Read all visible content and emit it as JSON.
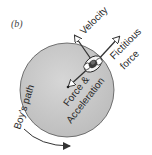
{
  "panel_label": "(b)",
  "labels": {
    "velocity": "Velocity",
    "fictitious_line1": "Fictitious",
    "fictitious_line2": "force",
    "force_line1": "Force &",
    "force_line2": "Acceleration",
    "path": "Boy's path"
  },
  "colors": {
    "disk_fill": "#c9c9c9",
    "disk_stroke": "#555555",
    "arrow": "#333333",
    "text": "#2a2a2a"
  },
  "icons": {
    "person": "boy-top-view-icon"
  }
}
